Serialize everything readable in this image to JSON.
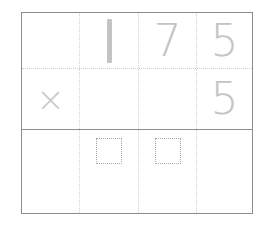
{
  "worksheet": {
    "type": "vertical-multiplication-grid",
    "problem": "175 x 5",
    "columns": 4,
    "rows": 3,
    "colors": {
      "frame": "#8c8c8c",
      "answer_line": "#8c8c8c",
      "dotted_divider": "#d2d2d2",
      "digit": "#c4c4c4",
      "operator": "#c9c9c9",
      "answer_box_border": "#a8a8a8",
      "background": "#ffffff"
    },
    "rows_data": [
      {
        "name": "multiplicand-row",
        "cells": [
          {
            "name": "operator-slot",
            "value": "",
            "kind": "empty"
          },
          {
            "name": "hundreds-digit",
            "value": "1",
            "kind": "digit"
          },
          {
            "name": "tens-digit",
            "value": "7",
            "kind": "digit"
          },
          {
            "name": "ones-digit",
            "value": "5",
            "kind": "digit"
          }
        ]
      },
      {
        "name": "multiplier-row",
        "cells": [
          {
            "name": "operator",
            "value": "×",
            "kind": "operator"
          },
          {
            "name": "hundreds-digit",
            "value": "",
            "kind": "empty"
          },
          {
            "name": "tens-digit",
            "value": "",
            "kind": "empty"
          },
          {
            "name": "ones-digit",
            "value": "5",
            "kind": "digit"
          }
        ]
      },
      {
        "name": "answer-row",
        "cells": [
          {
            "name": "answer-slot-thousands",
            "value": "",
            "kind": "empty"
          },
          {
            "name": "answer-box-hundreds",
            "value": "",
            "kind": "answer-box"
          },
          {
            "name": "answer-box-tens",
            "value": "",
            "kind": "answer-box"
          },
          {
            "name": "answer-slot-ones",
            "value": "",
            "kind": "empty"
          }
        ]
      }
    ]
  }
}
